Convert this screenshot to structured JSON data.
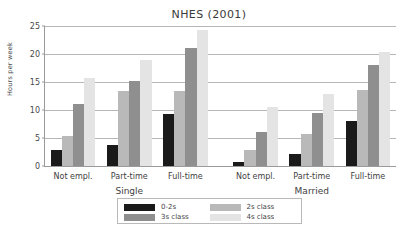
{
  "chart_data": {
    "type": "bar",
    "title": "NHES (2001)",
    "xlabel": "",
    "ylabel": "Hours per week",
    "ylim": [
      0,
      25
    ],
    "yticks": [
      0,
      5,
      10,
      15,
      20,
      25
    ],
    "ytick_labels": [
      "0",
      "5",
      "10",
      "15",
      "20",
      "25"
    ],
    "grid": true,
    "legend_position": "bottom",
    "group_labels": [
      "Single",
      "Married"
    ],
    "categories": [
      "Not empl.",
      "Part-time",
      "Full-time",
      "Not empl.",
      "Part-time",
      "Full-time"
    ],
    "category_groups": [
      "Single",
      "Single",
      "Single",
      "Married",
      "Married",
      "Married"
    ],
    "series": [
      {
        "name": "0-2s",
        "color": "#1a1a1a",
        "values": [
          2.8,
          3.7,
          9.3,
          0.7,
          2.2,
          8.0
        ]
      },
      {
        "name": "2s class",
        "color": "#b9b9b9",
        "values": [
          5.3,
          13.4,
          13.4,
          2.9,
          5.7,
          13.6
        ]
      },
      {
        "name": "3s class",
        "color": "#8f8f8f",
        "values": [
          11.0,
          15.1,
          21.0,
          6.1,
          9.5,
          18.0
        ]
      },
      {
        "name": "4s class",
        "color": "#e4e4e4",
        "values": [
          15.8,
          19.0,
          24.2,
          10.6,
          12.8,
          20.4
        ]
      }
    ]
  },
  "colors": {
    "background": "#ffffff",
    "axis": "#9a9a9a",
    "gridline": "#b6b6b6",
    "text": "#3b3b3b",
    "legend_border": "#b9b9b9"
  }
}
